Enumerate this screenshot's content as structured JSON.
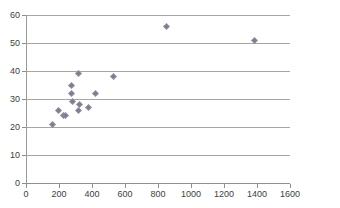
{
  "chart_data": {
    "type": "scatter",
    "title": "",
    "subtitle": "",
    "xlabel": "",
    "ylabel": "",
    "xlim": [
      0,
      1600
    ],
    "ylim": [
      0,
      60
    ],
    "xticks": [
      0,
      200,
      400,
      600,
      800,
      1000,
      1200,
      1400,
      1600
    ],
    "yticks": [
      0,
      10,
      20,
      30,
      40,
      50,
      60
    ],
    "grid": "horizontal",
    "legend": "none",
    "marker": "diamond",
    "marker_color": "#8b8b9c",
    "gridline_color": "#a6a6a6",
    "axis_color": "#8f8f8f",
    "background_color": "#ffffff",
    "label_color": "#404040",
    "series": [
      {
        "name": "series-1",
        "points": [
          {
            "x": 160,
            "y": 21
          },
          {
            "x": 195,
            "y": 26
          },
          {
            "x": 225,
            "y": 24
          },
          {
            "x": 238,
            "y": 24
          },
          {
            "x": 275,
            "y": 35
          },
          {
            "x": 278,
            "y": 32
          },
          {
            "x": 280,
            "y": 29
          },
          {
            "x": 318,
            "y": 39
          },
          {
            "x": 322,
            "y": 28
          },
          {
            "x": 320,
            "y": 26
          },
          {
            "x": 378,
            "y": 27
          },
          {
            "x": 420,
            "y": 32
          },
          {
            "x": 530,
            "y": 38
          },
          {
            "x": 850,
            "y": 56
          },
          {
            "x": 1385,
            "y": 51
          }
        ]
      }
    ]
  }
}
